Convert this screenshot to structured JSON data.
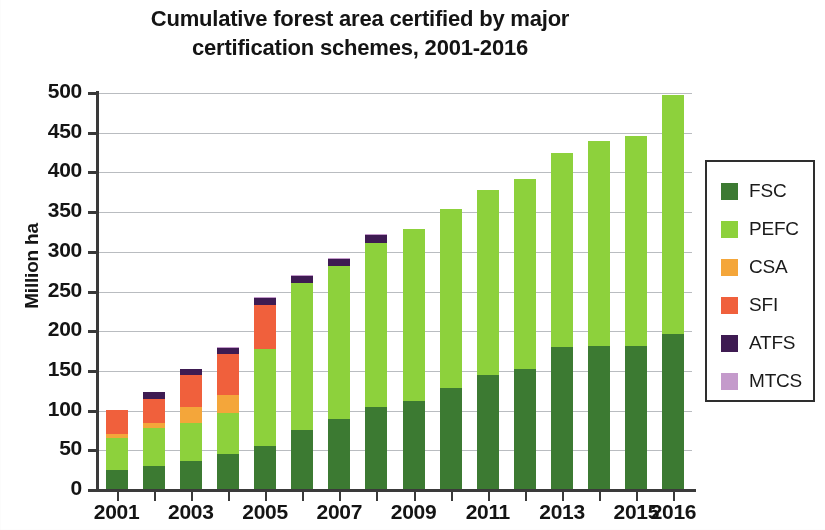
{
  "chart_data": {
    "type": "bar",
    "subtype": "stacked-bar",
    "title": "Cumulative forest area certified by major certification schemes, 2001-2016",
    "title_lines": [
      "Cumulative forest area certified by major",
      "certification schemes, 2001-2016"
    ],
    "xlabel": "",
    "ylabel": "Million ha",
    "ylim": [
      0,
      500
    ],
    "ytick_step": 50,
    "yticks": [
      0,
      50,
      100,
      150,
      200,
      250,
      300,
      350,
      400,
      450,
      500
    ],
    "ytick_labels": [
      "0",
      "50",
      "100",
      "150",
      "200",
      "250",
      "300",
      "350",
      "400",
      "450",
      "500"
    ],
    "grid": true,
    "grid_axis": "y",
    "legend_position": "right",
    "categories": [
      "2001",
      "2002",
      "2003",
      "2004",
      "2005",
      "2006",
      "2007",
      "2008",
      "2009",
      "2010",
      "2011",
      "2012",
      "2013",
      "2014",
      "2015",
      "2016"
    ],
    "xtick_labels_shown": [
      "2001",
      "2003",
      "2005",
      "2007",
      "2009",
      "2011",
      "2013",
      "2015",
      "2016"
    ],
    "series": [
      {
        "name": "FSC",
        "color": "#3C7A32",
        "values": [
          25,
          30,
          37,
          45,
          55,
          75,
          90,
          105,
          112,
          128,
          145,
          152,
          180,
          182,
          181,
          197
        ]
      },
      {
        "name": "PEFC",
        "color": "#8DD13C",
        "values": [
          40,
          48,
          47,
          52,
          122,
          186,
          192,
          206,
          217,
          226,
          233,
          240,
          244,
          258,
          265,
          301
        ]
      },
      {
        "name": "CSA",
        "color": "#F4A63A",
        "values": [
          5,
          7,
          20,
          23,
          0,
          0,
          0,
          0,
          0,
          0,
          0,
          0,
          0,
          0,
          0,
          0
        ]
      },
      {
        "name": "SFI",
        "color": "#F0603C",
        "values": [
          31,
          30,
          41,
          51,
          56,
          0,
          0,
          0,
          0,
          0,
          0,
          0,
          0,
          0,
          0,
          0
        ]
      },
      {
        "name": "ATFS",
        "color": "#3E1B52",
        "values": [
          0,
          8,
          8,
          8,
          9,
          9,
          9,
          10,
          0,
          0,
          0,
          0,
          0,
          0,
          0,
          0
        ]
      },
      {
        "name": "MTCS",
        "color": "#C49ACB",
        "values": [
          0,
          0,
          0,
          1,
          1,
          1,
          1,
          1,
          0,
          0,
          0,
          0,
          0,
          0,
          0,
          0
        ]
      }
    ],
    "totals": [
      101,
      123,
      153,
      180,
      243,
      271,
      292,
      322,
      329,
      354,
      378,
      392,
      424,
      440,
      446,
      498
    ]
  },
  "legend": {
    "items": [
      {
        "label": "FSC",
        "color": "#3C7A32"
      },
      {
        "label": "PEFC",
        "color": "#8DD13C"
      },
      {
        "label": "CSA",
        "color": "#F4A63A"
      },
      {
        "label": "SFI",
        "color": "#F0603C"
      },
      {
        "label": "ATFS",
        "color": "#3E1B52"
      },
      {
        "label": "MTCS",
        "color": "#C49ACB"
      }
    ]
  }
}
